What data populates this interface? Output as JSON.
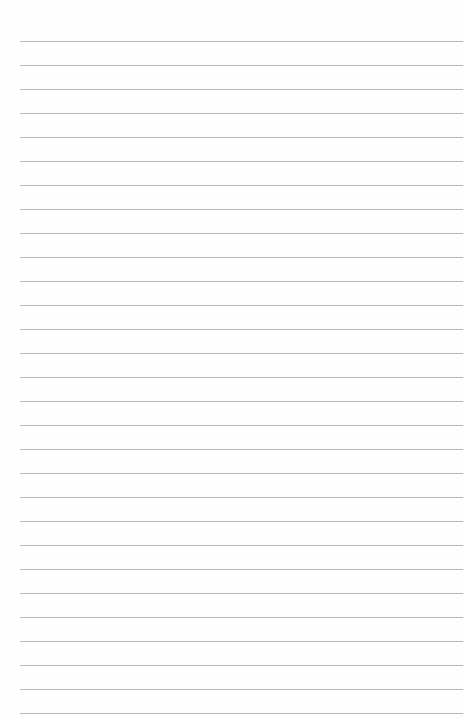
{
  "page": {
    "type": "lined-paper",
    "background": "#fefefe",
    "rule_color": "#b9b9b9",
    "rule_count": 29,
    "first_rule_y": 41,
    "rule_spacing": 24,
    "rule_left": 20,
    "rule_width": 443,
    "text": ""
  }
}
